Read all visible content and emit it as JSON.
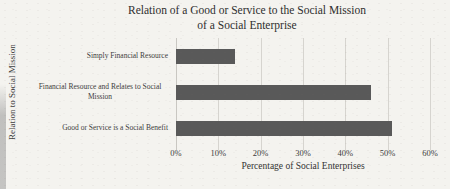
{
  "chart_data": {
    "type": "bar",
    "orientation": "horizontal",
    "title": "Relation of a Good or Service to the Social Mission of a Social Enterprise",
    "title_line1": "Relation of a Good or Service to the Social Mission",
    "title_line2": "of a Social Enterprise",
    "categories": [
      "Simply Financial Resource",
      "Financial Resource and Relates to Social Mission",
      "Good or Service is a Social Benefit"
    ],
    "values": [
      14,
      46,
      51
    ],
    "value_unit": "%",
    "xlabel": "Percentage of Social Enterprises",
    "ylabel": "Relation to Social Mission",
    "xlim": [
      0,
      60
    ],
    "xticks": [
      "0%",
      "10%",
      "20%",
      "30%",
      "40%",
      "50%",
      "60%"
    ],
    "grid": "vertical",
    "legend": "none",
    "bar_color": "#595959",
    "background_color": "#f4f3ef"
  }
}
